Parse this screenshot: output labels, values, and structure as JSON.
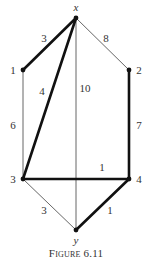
{
  "diagram": {
    "type": "weighted-graph",
    "nodes": [
      {
        "id": "x",
        "label": "x",
        "italic": true
      },
      {
        "id": "1",
        "label": "1",
        "italic": false
      },
      {
        "id": "2",
        "label": "2",
        "italic": false
      },
      {
        "id": "3",
        "label": "3",
        "italic": false
      },
      {
        "id": "4",
        "label": "4",
        "italic": false
      },
      {
        "id": "y",
        "label": "y",
        "italic": true
      }
    ],
    "edges": [
      {
        "from": "x",
        "to": "1",
        "weight": "3",
        "highlighted": true
      },
      {
        "from": "x",
        "to": "2",
        "weight": "8",
        "highlighted": false
      },
      {
        "from": "x",
        "to": "3",
        "weight": "4",
        "highlighted": true
      },
      {
        "from": "x",
        "to": "y",
        "weight": "10",
        "highlighted": false
      },
      {
        "from": "1",
        "to": "3",
        "weight": "6",
        "highlighted": false
      },
      {
        "from": "2",
        "to": "4",
        "weight": "7",
        "highlighted": true
      },
      {
        "from": "3",
        "to": "4",
        "weight": "1",
        "highlighted": true
      },
      {
        "from": "3",
        "to": "y",
        "weight": "3",
        "highlighted": false
      },
      {
        "from": "4",
        "to": "y",
        "weight": "1",
        "highlighted": true
      }
    ]
  },
  "caption": "Figure 6.11"
}
